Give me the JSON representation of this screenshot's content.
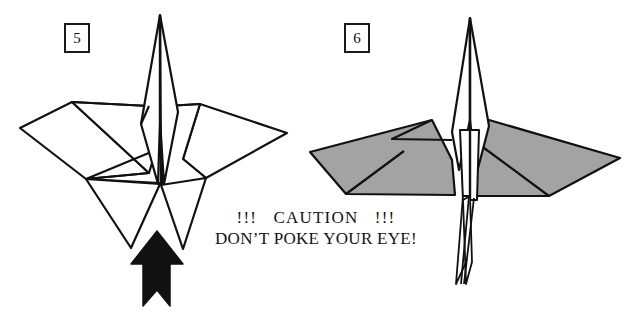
{
  "page": {
    "background_color": "#ffffff",
    "width": 639,
    "height": 316
  },
  "colors": {
    "ink": "#111111",
    "paper_white": "#ffffff",
    "paper_shaded": "#a3a3a3",
    "arrow_fill": "#111111"
  },
  "steps": [
    {
      "number": "5",
      "box_label": "5",
      "figure_name": "origami-model-front-view-white",
      "description": "White origami model with two wide wings, tall central point and two legs"
    },
    {
      "number": "6",
      "box_label": "6",
      "figure_name": "origami-model-front-view-shaded",
      "description": "Shaded origami model with wings spread flat and long thin tail spike"
    }
  ],
  "caution": {
    "line1": "!!!   CAUTION   !!!",
    "line2": "DON’T POKE YOUR EYE!"
  },
  "arrow": {
    "name": "push-arrow-up",
    "direction": "up",
    "label": ""
  },
  "figure5": {
    "outline_paths": [
      "M160,14 L148,128 L163,188 L176,112 Z",
      "M160,14 L149,130 L20,128 L72,102 Z",
      "M160,14 L176,110 L287,133 L200,104 Z"
    ],
    "wing_left": "M72,102 L20,128 L85,178 L150,172 Z",
    "wing_right": "M200,104 L287,133 L205,178 L168,150 Z",
    "leg_left": "M150,172 L130,245 L160,186 Z",
    "leg_right": "M162,187 L182,248 L205,178 Z"
  },
  "figure6": {
    "wing_left": "M437,120 L310,152 L345,193 L455,196 Z",
    "wing_right": "M487,120 L620,158 L548,196 L470,196 Z",
    "spike_top": "M470,18 L456,130 L470,196 L488,126 Z",
    "tail": "M470,196 L462,282 L478,280 Z"
  }
}
